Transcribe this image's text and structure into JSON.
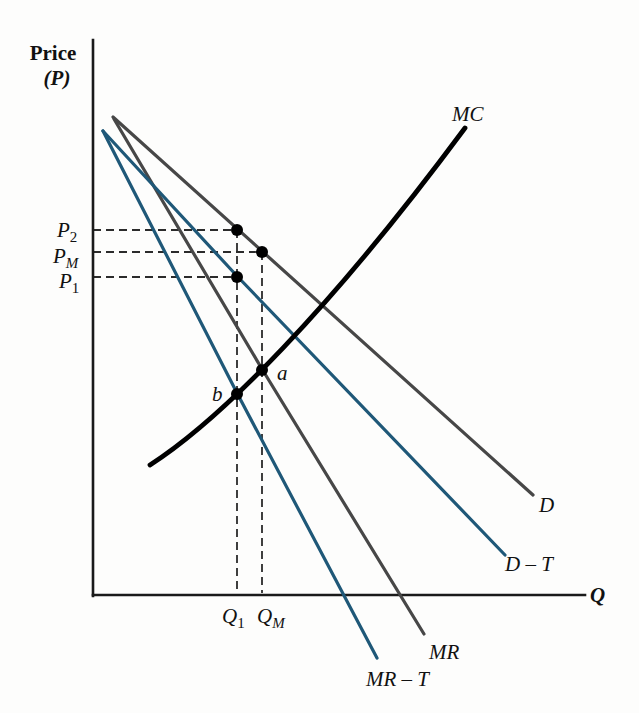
{
  "figure": {
    "background": "#fdfdfc",
    "y_axis_label": {
      "line1": "Price",
      "line2": "(P)"
    },
    "x_axis_label": "Q",
    "curves": {
      "mc": {
        "label": "MC",
        "color": "#000000"
      },
      "d": {
        "label": "D",
        "color": "#474747"
      },
      "d_t": {
        "label": "D – T",
        "color": "#1f5878"
      },
      "mr": {
        "label": "MR",
        "color": "#474747"
      },
      "mr_t": {
        "label": "MR – T",
        "color": "#1f5878"
      }
    },
    "markers": {
      "p2": {
        "main": "P",
        "sub": "2"
      },
      "pm": {
        "main": "P",
        "sub": "M"
      },
      "p1": {
        "main": "P",
        "sub": "1"
      },
      "q1": {
        "main": "Q",
        "sub": "1"
      },
      "qm": {
        "main": "Q",
        "sub": "M"
      },
      "a": "a",
      "b": "b"
    },
    "geometry": {
      "paths": {
        "y_axis": "M93,40 L93,596",
        "x_axis": "M93,595 L585,595",
        "d_curve": "M113,117 L533,495",
        "d_t_curve": "M103,131 L237,276 L505,555",
        "mr_curve": "M114,119 L262,369 L424,634",
        "mr_t_curve": "M103,131 L237,393 L377,658",
        "mc_curve": "M150,465 C220,420 330,310 465,128",
        "guide_p2": "M93,230 L237,230",
        "guide_pm": "M93,252 L262,252",
        "guide_p1": "M93,277 L237,277",
        "guide_q1": "M237,230 L237,593",
        "guide_qm": "M262,252 L262,593"
      },
      "dots": [
        {
          "x": 237,
          "y": 230
        },
        {
          "x": 262,
          "y": 252
        },
        {
          "x": 237,
          "y": 277
        },
        {
          "x": 262,
          "y": 370
        },
        {
          "x": 237,
          "y": 394
        }
      ]
    }
  },
  "chart_data": {
    "type": "line",
    "xlabel": "Q",
    "ylabel": "Price (P)",
    "xlim": [
      0,
      100
    ],
    "ylim": [
      0,
      100
    ],
    "grid": false,
    "axes_numeric": false,
    "units": "relative 0–100 scale estimated from figure geometry; source axes carry no numeric ticks",
    "series": [
      {
        "name": "MC",
        "color": "#000000",
        "style": "convex increasing curve",
        "x": [
          12,
          29,
          34,
          47,
          76
        ],
        "y": [
          23,
          36,
          41,
          53,
          84
        ]
      },
      {
        "name": "D",
        "color": "#474747",
        "style": "straight",
        "x": [
          4,
          89
        ],
        "y": [
          86,
          18
        ]
      },
      {
        "name": "D – T",
        "color": "#1f5878",
        "style": "straight",
        "x": [
          2,
          84
        ],
        "y": [
          84,
          7
        ]
      },
      {
        "name": "MR",
        "color": "#474747",
        "style": "straight",
        "x": [
          4,
          67
        ],
        "y": [
          86,
          -7
        ]
      },
      {
        "name": "MR – T",
        "color": "#1f5878",
        "style": "straight",
        "x": [
          2,
          58
        ],
        "y": [
          84,
          -11
        ]
      }
    ],
    "key_points": [
      {
        "label": "a",
        "meaning": "MC = MR intersection (pre-tax optimum)",
        "q": 34,
        "p": 41
      },
      {
        "label": "b",
        "meaning": "MC = MR – T intersection (post-tax optimum)",
        "q": 29,
        "p": 36
      },
      {
        "label": "P2",
        "meaning": "price on D at Q1",
        "q": 29,
        "p": 66
      },
      {
        "label": "PM",
        "meaning": "price on D at QM (monopoly price)",
        "q": 34,
        "p": 62
      },
      {
        "label": "P1",
        "meaning": "price on D – T at Q1",
        "q": 29,
        "p": 57
      }
    ],
    "reference_lines": {
      "prices": [
        {
          "label": "P2",
          "value": 66
        },
        {
          "label": "PM",
          "value": 62
        },
        {
          "label": "P1",
          "value": 57
        }
      ],
      "quantities": [
        {
          "label": "Q1",
          "value": 29
        },
        {
          "label": "QM",
          "value": 34
        }
      ]
    },
    "legend_position": "labels at line ends"
  }
}
